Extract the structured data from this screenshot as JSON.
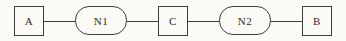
{
  "diagram": {
    "nodes": [
      {
        "id": "A",
        "label": "A",
        "shape": "square"
      },
      {
        "id": "N1",
        "label": "N1",
        "shape": "stadium"
      },
      {
        "id": "C",
        "label": "C",
        "shape": "square"
      },
      {
        "id": "N2",
        "label": "N2",
        "shape": "stadium"
      },
      {
        "id": "B",
        "label": "B",
        "shape": "square"
      }
    ],
    "edges": [
      {
        "from": "A",
        "to": "N1"
      },
      {
        "from": "N1",
        "to": "C"
      },
      {
        "from": "C",
        "to": "N2"
      },
      {
        "from": "N2",
        "to": "B"
      }
    ],
    "colors": {
      "stroke": "#3d3d3b",
      "background": "#fbfaf7",
      "text": "#2d2d2b"
    }
  }
}
